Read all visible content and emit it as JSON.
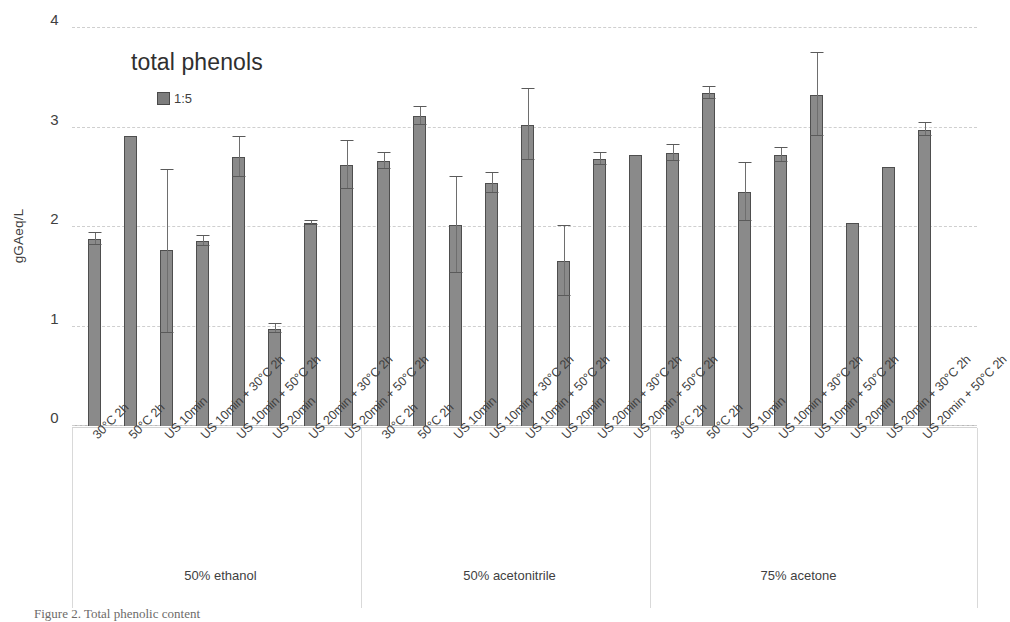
{
  "chart_data": {
    "type": "bar",
    "title": "total phenols",
    "xlabel": "",
    "ylabel": "gGAeq/L",
    "ylim": [
      0,
      4
    ],
    "yticks": [
      0,
      1,
      2,
      3,
      4
    ],
    "grid": true,
    "legend_position": "inside-top-left",
    "legend": [
      "1:5"
    ],
    "group_labels": [
      "50% ethanol",
      "50% acetonitrile",
      "75% acetone"
    ],
    "categories": [
      "30°C 2h",
      "50°C 2h",
      "US 10min",
      "US 10min + 30°C 2h",
      "US 10min + 50°C 2h",
      "US 20min",
      "US 20min + 30°C 2h",
      "US 20min + 50°C 2h"
    ],
    "series": [
      {
        "name": "1:5",
        "groups": [
          {
            "group": "50% ethanol",
            "values": [
              1.88,
              2.91,
              1.77,
              1.86,
              2.7,
              0.98,
              2.04,
              2.62
            ],
            "err_low": [
              0.06,
              0.0,
              0.84,
              0.05,
              0.2,
              0.05,
              0.02,
              0.24
            ],
            "err_high": [
              0.06,
              0.0,
              0.8,
              0.05,
              0.2,
              0.05,
              0.02,
              0.24
            ]
          },
          {
            "group": "50% acetonitrile",
            "values": [
              2.66,
              3.12,
              2.02,
              2.44,
              3.03,
              1.66,
              2.68,
              2.72
            ],
            "err_low": [
              0.08,
              0.09,
              0.48,
              0.1,
              0.36,
              0.35,
              0.06,
              0.0
            ],
            "err_high": [
              0.08,
              0.09,
              0.48,
              0.1,
              0.36,
              0.35,
              0.06,
              0.0
            ]
          },
          {
            "group": "75% acetone",
            "values": [
              2.74,
              3.35,
              2.35,
              2.72,
              3.33,
              2.04,
              2.6,
              2.98
            ],
            "err_low": [
              0.08,
              0.06,
              0.29,
              0.07,
              0.42,
              0.0,
              0.0,
              0.07
            ],
            "err_high": [
              0.08,
              0.06,
              0.29,
              0.07,
              0.42,
              0.0,
              0.0,
              0.07
            ]
          }
        ]
      }
    ],
    "colors": {
      "bar_fill": "#8a8a8a",
      "bar_edge": "#4e4e4e",
      "grid": "#cfcfcf",
      "text": "#3f3f3f",
      "background": "#ffffff"
    }
  },
  "caption": "Figure 2.  Total phenolic content"
}
